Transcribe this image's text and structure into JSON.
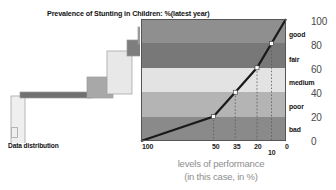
{
  "figure": {
    "title": "Prevalence of Stunting in Children: %(latest year)",
    "distribution_caption": "Data distribution",
    "x_caption_line1": "levels of performance",
    "x_caption_line2": "(in this case, in %)"
  },
  "chart_data": {
    "type": "line",
    "title": "Prevalence of Stunting in Children: %(latest year)",
    "xlabel": "levels of performance (in this case, in %)",
    "ylabel": "",
    "xlim": [
      100,
      0
    ],
    "ylim": [
      0,
      100
    ],
    "grid": false,
    "x_reversed": true,
    "x_ticks": [
      "100",
      "50",
      "35",
      "20",
      "10",
      "0"
    ],
    "x_tick_values": [
      100,
      50,
      35,
      20,
      10,
      0
    ],
    "y_ticks": [
      "0",
      "20",
      "40",
      "60",
      "80",
      "100"
    ],
    "y_tick_values": [
      0,
      20,
      40,
      60,
      80,
      100
    ],
    "series": [
      {
        "name": "performance curve",
        "x": [
          100,
          50,
          35,
          20,
          10,
          0
        ],
        "values": [
          0,
          20,
          40,
          60,
          80,
          100
        ],
        "marker": "white-square",
        "marker_x": [
          50,
          35,
          20,
          10
        ],
        "marker_y": [
          20,
          40,
          60,
          80
        ],
        "color": "#1a1a1a"
      }
    ],
    "bands": [
      {
        "label": "good",
        "y_from": 80,
        "y_to": 100,
        "color": "#8f8f8f"
      },
      {
        "label": "fair",
        "y_from": 60,
        "y_to": 80,
        "color": "#787878"
      },
      {
        "label": "medium",
        "y_from": 40,
        "y_to": 60,
        "color": "#e3e3e3"
      },
      {
        "label": "poor",
        "y_from": 20,
        "y_to": 40,
        "color": "#b4b4b4"
      },
      {
        "label": "bad",
        "y_from": 0,
        "y_to": 20,
        "color": "#8a8a8a"
      }
    ],
    "distribution": {
      "name": "Data distribution",
      "steps": [
        {
          "index": 0,
          "color": "#efefef",
          "x": 11,
          "y": 78,
          "w": 14,
          "h": 58
        },
        {
          "index": 1,
          "color": "#707070",
          "x": 20,
          "y": 74,
          "w": 72,
          "h": 6
        },
        {
          "index": 2,
          "color": "#a8a8a8",
          "x": 87,
          "y": 59,
          "w": 26,
          "h": 21
        },
        {
          "index": 3,
          "color": "#e8e8e8",
          "x": 107,
          "y": 33,
          "w": 25,
          "h": 43
        },
        {
          "index": 4,
          "color": "#7e7e7e",
          "x": 127,
          "y": 22,
          "w": 15,
          "h": 16
        },
        {
          "index": 5,
          "color": "#9a9a9a",
          "x": 138,
          "y": 9,
          "w": 18,
          "h": 17
        }
      ]
    }
  },
  "band_labels": [
    {
      "label": "good",
      "top": 31
    },
    {
      "label": "fair",
      "top": 56
    },
    {
      "label": "medium",
      "top": 79
    },
    {
      "label": "poor",
      "top": 103
    },
    {
      "label": "bad",
      "top": 126
    }
  ],
  "y_axis": {
    "ticks": [
      {
        "label": "100",
        "top": 16
      },
      {
        "label": "80",
        "top": 40
      },
      {
        "label": "60",
        "top": 64
      },
      {
        "label": "40",
        "top": 88
      },
      {
        "label": "20",
        "top": 112
      },
      {
        "label": "0",
        "top": 136
      }
    ]
  },
  "x_axis": {
    "ticks": [
      {
        "label": "100",
        "left": 142,
        "top": 143
      },
      {
        "label": "50",
        "left": 212,
        "top": 143
      },
      {
        "label": "35",
        "left": 233,
        "top": 143
      },
      {
        "label": "20",
        "left": 254,
        "top": 143
      },
      {
        "label": "10",
        "left": 268,
        "top": 149
      },
      {
        "label": "0",
        "left": 285,
        "top": 143
      }
    ]
  }
}
